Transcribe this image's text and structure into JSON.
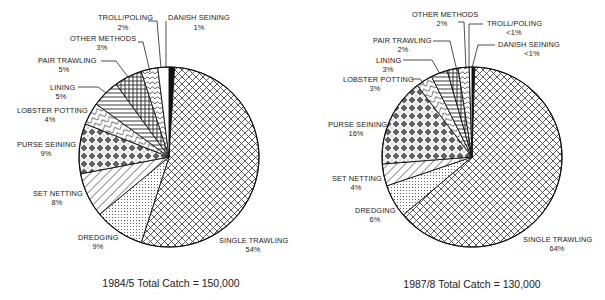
{
  "chart_data": [
    {
      "type": "pie",
      "title": "1984/5 Total Catch = 150,000",
      "categories": [
        "DANISH SEINING",
        "SINGLE TRAWLING",
        "DREDGING",
        "SET NETTING",
        "PURSE SEINING",
        "LOBSTER POTTING",
        "LINING",
        "PAIR TRAWLING",
        "OTHER METHODS",
        "TROLL/POLING"
      ],
      "values": [
        1,
        54,
        9,
        8,
        9,
        4,
        5,
        5,
        3,
        2
      ],
      "value_labels": [
        "1%",
        "54%",
        "9%",
        "8%",
        "9%",
        "4%",
        "5%",
        "5%",
        "3%",
        "2%"
      ],
      "start_angle": "12 o'clock, clockwise",
      "legend": "none (direct labels with leader lines)"
    },
    {
      "type": "pie",
      "title": "1987/8 Total Catch = 130,000",
      "categories": [
        "DANISH SEINING",
        "SINGLE TRAWLING",
        "DREDGING",
        "SET NETTING",
        "PURSE SEINING",
        "LOBSTER POTTING",
        "LINING",
        "PAIR TRAWLING",
        "OTHER METHODS",
        "TROLL/POLING"
      ],
      "values": [
        0.5,
        64,
        6,
        4,
        16,
        3,
        3,
        2,
        2,
        0.5
      ],
      "value_labels": [
        "<1%",
        "64%",
        "6%",
        "4%",
        "16%",
        "3%",
        "3%",
        "2%",
        "2%",
        "<1%"
      ],
      "start_angle": "12 o'clock, clockwise",
      "legend": "none (direct labels with leader lines)"
    }
  ],
  "charts": {
    "left": {
      "caption": "1984/5 Total Catch = 150,000",
      "labels": {
        "danish": {
          "name": "DANISH SEINING",
          "pct": "1%"
        },
        "single": {
          "name": "SINGLE TRAWLING",
          "pct": "54%"
        },
        "dredging": {
          "name": "DREDGING",
          "pct": "9%"
        },
        "setnet": {
          "name": "SET NETTING",
          "pct": "8%"
        },
        "purse": {
          "name": "PURSE SEINING",
          "pct": "9%"
        },
        "lobster": {
          "name": "LOBSTER POTTING",
          "pct": "4%"
        },
        "lining": {
          "name": "LINING",
          "pct": "5%"
        },
        "pair": {
          "name": "PAIR TRAWLING",
          "pct": "5%"
        },
        "other": {
          "name": "OTHER METHODS",
          "pct": "3%"
        },
        "troll": {
          "name": "TROLL/POLING",
          "pct": "2%"
        }
      }
    },
    "right": {
      "caption": "1987/8 Total Catch = 130,000",
      "labels": {
        "danish": {
          "name": "DANISH SEINING",
          "pct": "<1%"
        },
        "single": {
          "name": "SINGLE TRAWLING",
          "pct": "64%"
        },
        "dredging": {
          "name": "DREDGING",
          "pct": "6%"
        },
        "setnet": {
          "name": "SET NETTING",
          "pct": "4%"
        },
        "purse": {
          "name": "PURSE SEINING",
          "pct": "16%"
        },
        "lobster": {
          "name": "LOBSTER POTTING",
          "pct": "3%"
        },
        "lining": {
          "name": "LINING",
          "pct": "3%"
        },
        "pair": {
          "name": "PAIR TRAWLING",
          "pct": "2%"
        },
        "other": {
          "name": "OTHER METHODS",
          "pct": "2%"
        },
        "troll": {
          "name": "TROLL/POLING",
          "pct": "<1%"
        }
      }
    }
  }
}
